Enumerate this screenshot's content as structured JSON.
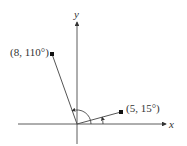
{
  "diagram": {
    "type": "polar-coordinates-plot",
    "axes": {
      "x_label": "x",
      "y_label": "y"
    },
    "points": [
      {
        "label": "(8, 110°)",
        "r": 8,
        "theta_deg": 110
      },
      {
        "label": "(5, 15°)",
        "r": 5,
        "theta_deg": 15
      }
    ],
    "colors": {
      "axis": "#333333",
      "segment": "#555555",
      "point": "#111111"
    }
  }
}
